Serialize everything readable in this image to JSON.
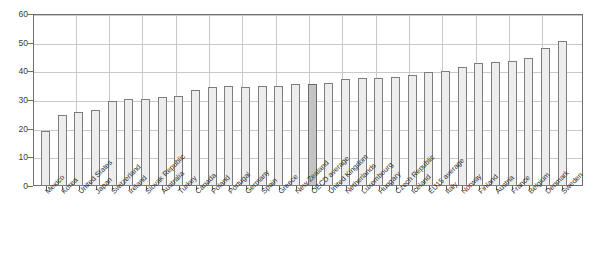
{
  "chart_data": {
    "type": "bar",
    "title": "",
    "subtitle": "",
    "xlabel": "",
    "ylabel": "",
    "ylim": [
      0,
      60
    ],
    "y_ticks": [
      0,
      10,
      20,
      30,
      40,
      50,
      60
    ],
    "grid": true,
    "legend": "none",
    "highlight_category": "OECD average",
    "highlight_color": "#c3c3c3",
    "bar_color": "#ededed",
    "bar_border_color": "#7d7d7d",
    "categories": [
      "Mexico",
      "Korea",
      "United States",
      "Japan",
      "Switzerland",
      "Ireland",
      "Slovak Republic",
      "Australia",
      "Turkey",
      "Canada",
      "Poland",
      "Portugal",
      "Germany",
      "Spain",
      "Greece",
      "New Zealand",
      "OECD average",
      "United Kingdom",
      "Netherlands",
      "Luxembourg",
      "Hungary",
      "Czech Republic",
      "Iceland",
      "EU15 average",
      "Italy",
      "Norway",
      "Finland",
      "Austria",
      "France",
      "Belgium",
      "Denmark",
      "Sweden"
    ],
    "values": [
      19.1,
      24.7,
      25.8,
      26.4,
      29.5,
      30.4,
      30.5,
      31.2,
      31.5,
      33.5,
      34.6,
      34.8,
      34.7,
      34.8,
      34.9,
      35.5,
      35.7,
      35.8,
      37.5,
      37.8,
      37.8,
      38.1,
      38.7,
      39.8,
      40.2,
      41.5,
      43.0,
      43.2,
      43.5,
      44.5,
      48.3,
      50.5
    ]
  }
}
